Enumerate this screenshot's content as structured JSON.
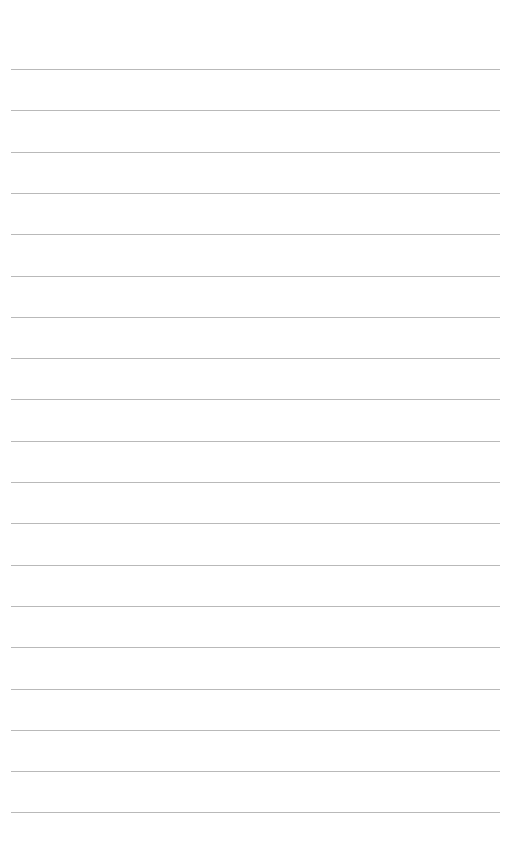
{
  "page": {
    "type": "lined-paper",
    "background_color": "#ffffff",
    "line_color": "#b9b9b9",
    "line_count": 19,
    "first_line_y": 69,
    "line_spacing": 41.3
  }
}
